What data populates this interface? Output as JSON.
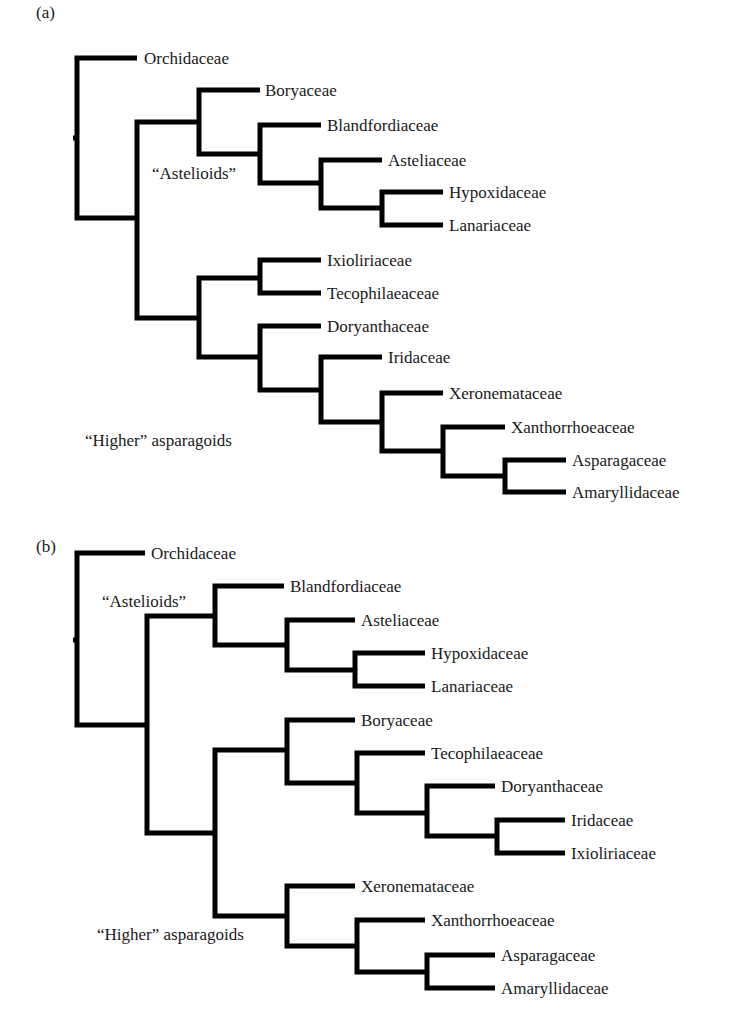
{
  "figure": {
    "panels": [
      {
        "id": "a",
        "label": "(a)",
        "label_pos": [
          36,
          18
        ],
        "root_tick": {
          "x": 77,
          "y": 138
        },
        "branches": [
          {
            "points": [
              [
                137,
                58
              ],
              [
                77,
                58
              ],
              [
                77,
                218
              ],
              [
                137,
                218
              ]
            ]
          },
          {
            "points": [
              [
                199,
                122
              ],
              [
                137,
                122
              ],
              [
                137,
                318
              ],
              [
                199,
                318
              ]
            ]
          },
          {
            "points": [
              [
                260,
                90
              ],
              [
                199,
                90
              ],
              [
                199,
                154
              ],
              [
                260,
                154
              ]
            ]
          },
          {
            "points": [
              [
                321,
                125
              ],
              [
                260,
                125
              ],
              [
                260,
                183
              ],
              [
                321,
                183
              ]
            ]
          },
          {
            "points": [
              [
                382,
                160
              ],
              [
                321,
                160
              ],
              [
                321,
                208
              ],
              [
                382,
                208
              ]
            ]
          },
          {
            "points": [
              [
                443,
                192
              ],
              [
                382,
                192
              ],
              [
                382,
                225
              ],
              [
                443,
                225
              ]
            ]
          },
          {
            "points": [
              [
                260,
                278
              ],
              [
                199,
                278
              ],
              [
                199,
                357
              ],
              [
                260,
                357
              ]
            ]
          },
          {
            "points": [
              [
                321,
                260
              ],
              [
                260,
                260
              ],
              [
                260,
                293
              ],
              [
                321,
                293
              ]
            ]
          },
          {
            "points": [
              [
                321,
                326
              ],
              [
                260,
                326
              ],
              [
                260,
                390
              ],
              [
                321,
                390
              ]
            ]
          },
          {
            "points": [
              [
                382,
                357
              ],
              [
                321,
                357
              ],
              [
                321,
                422
              ],
              [
                382,
                422
              ]
            ]
          },
          {
            "points": [
              [
                443,
                393
              ],
              [
                382,
                393
              ],
              [
                382,
                451
              ],
              [
                443,
                451
              ]
            ]
          },
          {
            "points": [
              [
                505,
                427
              ],
              [
                443,
                427
              ],
              [
                443,
                476
              ],
              [
                505,
                476
              ]
            ]
          },
          {
            "points": [
              [
                566,
                460
              ],
              [
                505,
                460
              ],
              [
                505,
                492
              ],
              [
                566,
                492
              ]
            ]
          }
        ],
        "taxa": [
          {
            "name": "Orchidaceae",
            "x": 144,
            "y": 64
          },
          {
            "name": "Boryaceae",
            "x": 265,
            "y": 96
          },
          {
            "name": "Blandfordiaceae",
            "x": 327,
            "y": 131
          },
          {
            "name": "Asteliaceae",
            "x": 388,
            "y": 166
          },
          {
            "name": "Hypoxidaceae",
            "x": 449,
            "y": 198
          },
          {
            "name": "Lanariaceae",
            "x": 449,
            "y": 231
          },
          {
            "name": "Ixioliriaceae",
            "x": 327,
            "y": 266
          },
          {
            "name": "Tecophilaeaceae",
            "x": 327,
            "y": 299
          },
          {
            "name": "Doryanthaceae",
            "x": 327,
            "y": 332
          },
          {
            "name": "Iridaceae",
            "x": 388,
            "y": 363
          },
          {
            "name": "Xeronemataceae",
            "x": 449,
            "y": 399
          },
          {
            "name": "Xanthorrhoeaceae",
            "x": 511,
            "y": 433
          },
          {
            "name": "Asparagaceae",
            "x": 572,
            "y": 466
          },
          {
            "name": "Amaryllidaceae",
            "x": 572,
            "y": 498
          }
        ],
        "clade_labels": [
          {
            "text": "“Astelioids”",
            "x": 152,
            "y": 179
          },
          {
            "text": "“Higher” asparagoids",
            "x": 85,
            "y": 446
          }
        ]
      },
      {
        "id": "b",
        "label": "(b)",
        "label_pos": [
          36,
          552
        ],
        "root_tick": {
          "x": 77,
          "y": 640
        },
        "branches": [
          {
            "points": [
              [
                145,
                553
              ],
              [
                77,
                553
              ],
              [
                77,
                725
              ],
              [
                147,
                725
              ]
            ]
          },
          {
            "points": [
              [
                215,
                616
              ],
              [
                147,
                616
              ],
              [
                147,
                833
              ],
              [
                215,
                833
              ]
            ]
          },
          {
            "points": [
              [
                284,
                586
              ],
              [
                215,
                586
              ],
              [
                215,
                645
              ],
              [
                287,
                645
              ]
            ]
          },
          {
            "points": [
              [
                355,
                620
              ],
              [
                287,
                620
              ],
              [
                287,
                670
              ],
              [
                355,
                670
              ]
            ]
          },
          {
            "points": [
              [
                425,
                653
              ],
              [
                355,
                653
              ],
              [
                355,
                686
              ],
              [
                425,
                686
              ]
            ]
          },
          {
            "points": [
              [
                287,
                750
              ],
              [
                215,
                750
              ],
              [
                215,
                916
              ],
              [
                287,
                916
              ]
            ]
          },
          {
            "points": [
              [
                355,
                720
              ],
              [
                287,
                720
              ],
              [
                287,
                783
              ],
              [
                357,
                783
              ]
            ]
          },
          {
            "points": [
              [
                425,
                753
              ],
              [
                357,
                753
              ],
              [
                357,
                813
              ],
              [
                427,
                813
              ]
            ]
          },
          {
            "points": [
              [
                495,
                786
              ],
              [
                427,
                786
              ],
              [
                427,
                836
              ],
              [
                497,
                836
              ]
            ]
          },
          {
            "points": [
              [
                565,
                820
              ],
              [
                497,
                820
              ],
              [
                497,
                853
              ],
              [
                565,
                853
              ]
            ]
          },
          {
            "points": [
              [
                355,
                886
              ],
              [
                287,
                886
              ],
              [
                287,
                946
              ],
              [
                357,
                946
              ]
            ]
          },
          {
            "points": [
              [
                425,
                920
              ],
              [
                357,
                920
              ],
              [
                357,
                972
              ],
              [
                427,
                972
              ]
            ]
          },
          {
            "points": [
              [
                495,
                955
              ],
              [
                427,
                955
              ],
              [
                427,
                988
              ],
              [
                495,
                988
              ]
            ]
          }
        ],
        "taxa": [
          {
            "name": "Orchidaceae",
            "x": 151,
            "y": 559
          },
          {
            "name": "Blandfordiaceae",
            "x": 290,
            "y": 592
          },
          {
            "name": "Asteliaceae",
            "x": 361,
            "y": 626
          },
          {
            "name": "Hypoxidaceae",
            "x": 431,
            "y": 659
          },
          {
            "name": "Lanariaceae",
            "x": 431,
            "y": 692
          },
          {
            "name": "Boryaceae",
            "x": 361,
            "y": 726
          },
          {
            "name": "Tecophilaeaceae",
            "x": 431,
            "y": 759
          },
          {
            "name": "Doryanthaceae",
            "x": 501,
            "y": 792
          },
          {
            "name": "Iridaceae",
            "x": 571,
            "y": 826
          },
          {
            "name": "Ixioliriaceae",
            "x": 571,
            "y": 859
          },
          {
            "name": "Xeronemataceae",
            "x": 361,
            "y": 892
          },
          {
            "name": "Xanthorrhoeaceae",
            "x": 431,
            "y": 926
          },
          {
            "name": "Asparagaceae",
            "x": 501,
            "y": 961
          },
          {
            "name": "Amaryllidaceae",
            "x": 501,
            "y": 994
          }
        ],
        "clade_labels": [
          {
            "text": "“Astelioids”",
            "x": 102,
            "y": 607
          },
          {
            "text": "“Higher” asparagoids",
            "x": 97,
            "y": 940
          }
        ]
      }
    ]
  }
}
